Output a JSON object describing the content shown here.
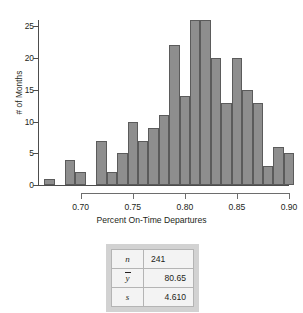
{
  "chart_data": {
    "type": "bar",
    "title": "",
    "subtitle": "",
    "xlabel": "Percent On-Time Departures",
    "ylabel": "# of Months",
    "xlim": [
      0.66,
      0.9
    ],
    "ylim": [
      0,
      26
    ],
    "grid": false,
    "legend": null,
    "bin_width": 0.01,
    "xticks": [
      0.7,
      0.75,
      0.8,
      0.85,
      0.9
    ],
    "xtick_labels": [
      "0.70",
      "0.75",
      "0.80",
      "0.85",
      "0.90"
    ],
    "yticks": [
      0,
      5,
      10,
      15,
      20,
      25
    ],
    "ytick_labels": [
      "0",
      "5",
      "10",
      "15",
      "20",
      "25"
    ],
    "bar_color": "#8e8e8e",
    "bar_edge_color": "#5b5b5b",
    "bin_starts": [
      0.665,
      0.675,
      0.685,
      0.695,
      0.705,
      0.715,
      0.725,
      0.735,
      0.745,
      0.755,
      0.765,
      0.775,
      0.785,
      0.795,
      0.805,
      0.815,
      0.825,
      0.835,
      0.845,
      0.855,
      0.865,
      0.875,
      0.885
    ],
    "values": [
      1,
      0,
      4,
      2,
      0,
      7,
      2,
      5,
      10,
      7,
      9,
      11,
      22,
      14,
      26,
      26,
      20,
      13,
      20,
      15,
      13,
      3,
      6,
      5
    ],
    "bars": [
      {
        "x": 0.665,
        "value": 1
      },
      {
        "x": 0.685,
        "value": 4
      },
      {
        "x": 0.695,
        "value": 2
      },
      {
        "x": 0.715,
        "value": 7
      },
      {
        "x": 0.725,
        "value": 2
      },
      {
        "x": 0.735,
        "value": 5
      },
      {
        "x": 0.745,
        "value": 10
      },
      {
        "x": 0.755,
        "value": 7
      },
      {
        "x": 0.765,
        "value": 9
      },
      {
        "x": 0.775,
        "value": 11
      },
      {
        "x": 0.785,
        "value": 22
      },
      {
        "x": 0.795,
        "value": 14
      },
      {
        "x": 0.805,
        "value": 26
      },
      {
        "x": 0.815,
        "value": 26
      },
      {
        "x": 0.825,
        "value": 20
      },
      {
        "x": 0.835,
        "value": 13
      },
      {
        "x": 0.845,
        "value": 20
      },
      {
        "x": 0.855,
        "value": 15
      },
      {
        "x": 0.865,
        "value": 13
      },
      {
        "x": 0.875,
        "value": 3
      },
      {
        "x": 0.885,
        "value": 6
      },
      {
        "x": 0.895,
        "value": 5
      }
    ]
  },
  "stats": {
    "rows": [
      {
        "symbol": "n",
        "value": "241",
        "overline": false
      },
      {
        "symbol": "y",
        "value": "80.65",
        "overline": true
      },
      {
        "symbol": "s",
        "value": "4.610",
        "overline": false
      }
    ]
  }
}
